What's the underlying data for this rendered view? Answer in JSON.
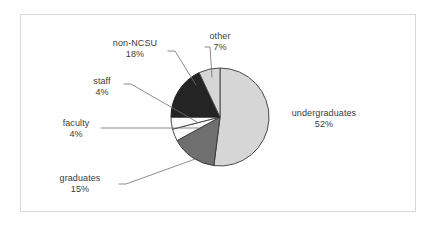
{
  "figure": {
    "background": "#ffffff",
    "frame_color": "#d9d9d9"
  },
  "chart_data": {
    "type": "pie",
    "title": "",
    "subtitle": "",
    "xlabel": "",
    "ylabel": "",
    "grid": false,
    "legend": "none",
    "labels_position": "outside-with-leader-lines",
    "start_angle_deg": 90,
    "direction": "clockwise",
    "units": "percent",
    "total": 100,
    "categories": [
      "undergraduates",
      "graduates",
      "faculty",
      "staff",
      "non-NCSU",
      "other"
    ],
    "values": [
      52,
      15,
      4,
      4,
      18,
      7
    ],
    "slices": [
      {
        "label": "undergraduates",
        "percent_text": "52%",
        "value": 52,
        "color": "#d6d6d6",
        "edge_color": "#4a4a4a",
        "start_deg": 0,
        "end_deg": 187.2
      },
      {
        "label": "graduates",
        "percent_text": "15%",
        "value": 15,
        "color": "#6f6f6f",
        "edge_color": "#3a3a3a",
        "start_deg": 187.2,
        "end_deg": 241.2
      },
      {
        "label": "faculty",
        "percent_text": "4%",
        "value": 4,
        "color": "#fbfbfb",
        "edge_color": "#3a3a3a",
        "start_deg": 241.2,
        "end_deg": 255.6
      },
      {
        "label": "staff",
        "percent_text": "4%",
        "value": 4,
        "color": "#fbfbfb",
        "edge_color": "#3a3a3a",
        "start_deg": 255.6,
        "end_deg": 270
      },
      {
        "label": "non-NCSU",
        "percent_text": "18%",
        "value": 18,
        "color": "#242424",
        "edge_color": "#1a1a1a",
        "start_deg": 270,
        "end_deg": 334.8
      },
      {
        "label": "other",
        "percent_text": "7%",
        "value": 7,
        "color": "#d6d6d6",
        "edge_color": "#4a4a4a",
        "start_deg": 334.8,
        "end_deg": 360
      }
    ]
  },
  "labels": {
    "undergraduates": {
      "name": "undergraduates",
      "percent": "52%"
    },
    "graduates": {
      "name": "graduates",
      "percent": "15%"
    },
    "faculty": {
      "name": "faculty",
      "percent": "4%"
    },
    "staff": {
      "name": "staff",
      "percent": "4%"
    },
    "non_ncsu": {
      "name": "non-NCSU",
      "percent": "18%"
    },
    "other": {
      "name": "other",
      "percent": "7%"
    }
  }
}
